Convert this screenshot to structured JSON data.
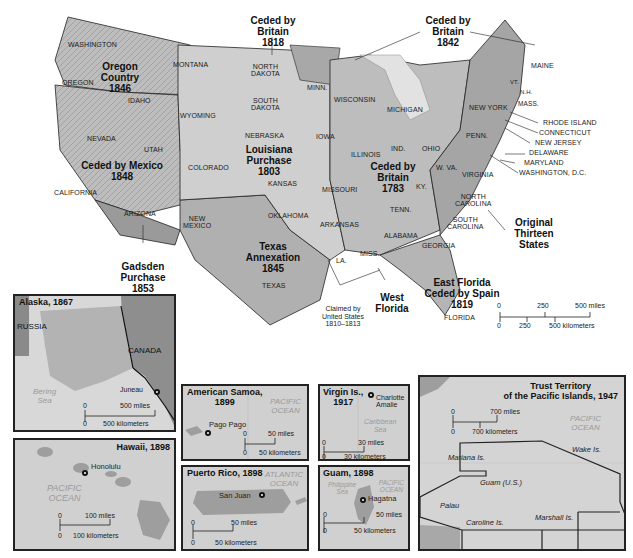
{
  "main_map": {
    "states": {
      "washington": "WASHINGTON",
      "oregon": "OREGON",
      "montana": "MONTANA",
      "idaho": "IDAHO",
      "wyoming": "WYOMING",
      "nevada": "NEVADA",
      "utah": "UTAH",
      "colorado": "COLORADO",
      "california": "CALIFORNIA",
      "arizona": "ARIZONA",
      "new_mexico": "NEW\nMEXICO",
      "north_dakota": "NORTH\nDAKOTA",
      "south_dakota": "SOUTH\nDAKOTA",
      "nebraska": "NEBRASKA",
      "kansas": "KANSAS",
      "oklahoma": "OKLAHOMA",
      "texas": "TEXAS",
      "minn": "MINN.",
      "iowa": "IOWA",
      "missouri": "MISSOURI",
      "arkansas": "ARKANSAS",
      "la": "LA.",
      "wisconsin": "WISCONSIN",
      "michigan": "MICHIGAN",
      "illinois": "ILLINOIS",
      "ind": "IND.",
      "ohio": "OHIO",
      "ky": "KY.",
      "tenn": "TENN.",
      "miss": "MISS.",
      "alabama": "ALABAMA",
      "georgia": "GEORGIA",
      "florida": "FLORIDA",
      "south_carolina": "SOUTH\nCAROLINA",
      "north_carolina": "NORTH\nCAROLINA",
      "virginia": "VIRGINIA",
      "w_va": "W. VA.",
      "penn": "PENN.",
      "new_york": "NEW YORK",
      "maine": "MAINE",
      "vt": "VT.",
      "nh": "N.H.",
      "mass": "MASS."
    },
    "east_callouts": [
      "RHODE ISLAND",
      "CONNECTICUT",
      "NEW JERSEY",
      "DELAWARE",
      "MARYLAND",
      "WASHINGTON, D.C."
    ],
    "acquisitions": {
      "ceded_1818": "Ceded by\nBritain\n1818",
      "ceded_1842": "Ceded by\nBritain\n1842",
      "oregon_country": "Oregon\nCountry\n1846",
      "ceded_mexico": "Ceded by Mexico\n1848",
      "louisiana": "Louisiana\nPurchase\n1803",
      "ceded_1783": "Ceded by\nBritain\n1783",
      "original_13": "Original\nThirteen\nStates",
      "gadsden": "Gadsden\nPurchase\n1853",
      "texas_annex": "Texas\nAnnexation\n1845",
      "east_florida": "East Florida\nCeded by Spain\n1819",
      "west_florida": "West\nFlorida",
      "claimed": "Claimed by\nUnited States\n1810–1813"
    },
    "scale": {
      "top": [
        "0",
        "250",
        "500 miles"
      ],
      "bottom": [
        "0",
        "250",
        "500 kilometers"
      ]
    }
  },
  "insets": {
    "alaska": {
      "title": "Alaska, 1867",
      "russia": "RUSSIA",
      "canada": "CANADA",
      "sea": "Bering\nSea",
      "city": "Juneau",
      "scale_top": "0",
      "scale_top_end": "500 miles",
      "scale_bottom": "0",
      "scale_bottom_end": "500 kilometers"
    },
    "hawaii": {
      "title": "Hawaii, 1898",
      "ocean": "PACIFIC\nOCEAN",
      "city": "Honolulu",
      "scale_top": "0",
      "scale_top_end": "100 miles",
      "scale_bottom": "0",
      "scale_bottom_end": "100 kilometers"
    },
    "samoa": {
      "title": "American Samoa,\n1899",
      "ocean": "PACIFIC\nOCEAN",
      "city": "Pago Pago",
      "scale_top": "0",
      "scale_top_end": "50 miles",
      "scale_bottom": "0",
      "scale_bottom_end": "50 kilometers"
    },
    "puerto_rico": {
      "title": "Puerto Rico, 1898",
      "ocean": "ATLANTIC\nOCEAN",
      "city": "San Juan",
      "scale_top": "0",
      "scale_top_end": "50 miles",
      "scale_bottom": "0",
      "scale_bottom_end": "50 kilometers"
    },
    "virgin": {
      "title": "Virgin Is.,\n1917",
      "sea": "Caribbean\nSea",
      "city": "Charlotte\nAmalie",
      "scale_top": "0",
      "scale_top_end": "30 miles",
      "scale_bottom": "0",
      "scale_bottom_end": "30 kilometers"
    },
    "guam": {
      "title": "Guam, 1898",
      "sea": "Philippine\nSea",
      "ocean": "PACIFIC\nOCEAN",
      "city": "Hagatna",
      "scale_top": "0",
      "scale_top_end": "50 miles",
      "scale_bottom": "0",
      "scale_bottom_end": "50 kilometers"
    },
    "trust": {
      "title": "Trust Territory\nof the Pacific Islands, 1947",
      "ocean": "PACIFIC\nOCEAN",
      "scale_top": "0",
      "scale_top_end": "700 miles",
      "scale_bottom": "0",
      "scale_bottom_end": "700 kilometers",
      "islands": [
        "Mariana Is.",
        "Guam (U.S.)",
        "Palau",
        "Caroline Is.",
        "Marshall Is.",
        "Wake Is."
      ]
    }
  }
}
